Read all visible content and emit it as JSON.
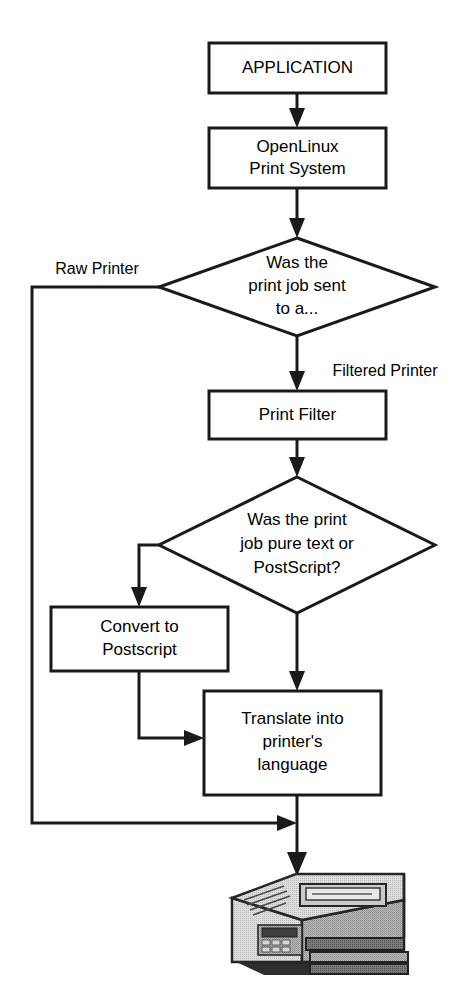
{
  "diagram": {
    "type": "flowchart",
    "colors": {
      "background": "#ffffff",
      "stroke": "#1a1a1a",
      "node_fill": "#ffffff",
      "text": "#000000",
      "printer_light": "#d8d8d8",
      "printer_mid": "#a8a8a8",
      "printer_dark": "#6e6e6e",
      "printer_darkest": "#3a3a3a"
    },
    "nodes": {
      "application": {
        "id": "application",
        "shape": "rectangle",
        "label": "APPLICATION",
        "lines": [
          "APPLICATION"
        ]
      },
      "print_system": {
        "id": "print_system",
        "shape": "rectangle",
        "label": "OpenLinux Print System",
        "lines": [
          "OpenLinux",
          "Print System"
        ]
      },
      "decision_printer_type": {
        "id": "decision_printer_type",
        "shape": "diamond",
        "label": "Was the print job sent to a...",
        "lines": [
          "Was the",
          "print job sent",
          "to a..."
        ]
      },
      "print_filter": {
        "id": "print_filter",
        "shape": "rectangle",
        "label": "Print Filter",
        "lines": [
          "Print Filter"
        ]
      },
      "decision_job_format": {
        "id": "decision_job_format",
        "shape": "diamond",
        "label": "Was the print job pure text or PostScript?",
        "lines": [
          "Was the print",
          "job pure text or",
          "PostScript?"
        ]
      },
      "convert_to_postscript": {
        "id": "convert_to_postscript",
        "shape": "rectangle",
        "label": "Convert to Postscript",
        "lines": [
          "Convert to",
          "Postscript"
        ]
      },
      "translate": {
        "id": "translate",
        "shape": "rectangle",
        "label": "Translate into printer's language",
        "lines": [
          "Translate into",
          "printer's",
          "language"
        ]
      },
      "printer": {
        "id": "printer",
        "shape": "illustration",
        "label": "laser printer",
        "icon": "printer-icon"
      }
    },
    "edge_labels": {
      "raw_printer": "Raw Printer",
      "filtered_printer": "Filtered Printer"
    },
    "edges": [
      {
        "from": "application",
        "to": "print_system",
        "label": ""
      },
      {
        "from": "print_system",
        "to": "decision_printer_type",
        "label": ""
      },
      {
        "from": "decision_printer_type",
        "to": "printer",
        "label": "Raw Printer"
      },
      {
        "from": "decision_printer_type",
        "to": "print_filter",
        "label": "Filtered Printer"
      },
      {
        "from": "print_filter",
        "to": "decision_job_format",
        "label": ""
      },
      {
        "from": "decision_job_format",
        "to": "convert_to_postscript",
        "label": ""
      },
      {
        "from": "decision_job_format",
        "to": "translate",
        "label": ""
      },
      {
        "from": "convert_to_postscript",
        "to": "translate",
        "label": ""
      },
      {
        "from": "translate",
        "to": "printer",
        "label": ""
      }
    ]
  }
}
